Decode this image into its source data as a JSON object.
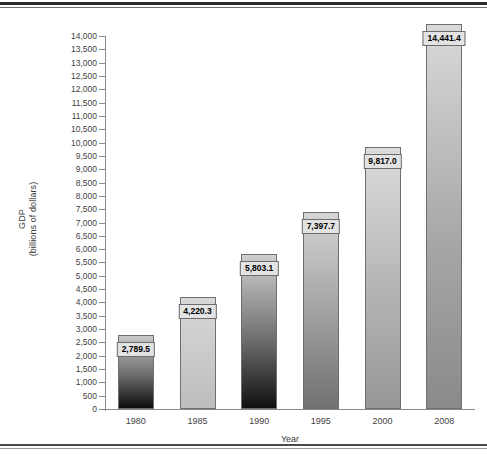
{
  "chart_data": {
    "type": "bar",
    "title": "",
    "categories": [
      "1980",
      "1985",
      "1990",
      "1995",
      "2000",
      "2008"
    ],
    "values": [
      2789.5,
      4220.3,
      5803.1,
      7397.7,
      9817.0,
      14441.4
    ],
    "value_labels": [
      "2,789.5",
      "4,220.3",
      "5,803.1",
      "7,397.7",
      "9,817.0",
      "14,441.4"
    ],
    "xlabel": "Year",
    "ylabel_line1": "GDP",
    "ylabel_line2": "(billions of dollars)",
    "ylim": [
      0,
      14000
    ],
    "ytick_step": 500,
    "ytick_labels": [
      "14,000",
      "13,500",
      "13,000",
      "12,500",
      "12,000",
      "11,500",
      "11,000",
      "10,500",
      "10,000",
      "9,500",
      "9,000",
      "8,500",
      "8,000",
      "7,500",
      "7,000",
      "6,500",
      "6,000",
      "5,500",
      "5,000",
      "4,500",
      "4,000",
      "3,500",
      "3,000",
      "2,500",
      "2,000",
      "1,500",
      "1,000",
      "500",
      "0"
    ],
    "ytick_values": [
      14000,
      13500,
      13000,
      12500,
      12000,
      11500,
      11000,
      10500,
      10000,
      9500,
      9000,
      8500,
      8000,
      7500,
      7000,
      6500,
      6000,
      5500,
      5000,
      4500,
      4000,
      3500,
      3000,
      2500,
      2000,
      1500,
      1000,
      500,
      0
    ],
    "grid": false,
    "legend": false,
    "bar_gradients": [
      {
        "top": "#c8c8c8",
        "mid": "#6a6a6a",
        "bottom": "#0d0d0d"
      },
      {
        "top": "#d8d8d8",
        "mid": "#c9c9c9",
        "bottom": "#bdbdbd"
      },
      {
        "top": "#cfcfcf",
        "mid": "#6f6f6f",
        "bottom": "#101010"
      },
      {
        "top": "#d5d5d5",
        "mid": "#9d9d9d",
        "bottom": "#717171"
      },
      {
        "top": "#dcdcdc",
        "mid": "#b4b4b4",
        "bottom": "#979797"
      },
      {
        "top": "#d9d9d9",
        "mid": "#a8a8a8",
        "bottom": "#8a8a8a"
      }
    ],
    "axis_color": "#8a8a8a",
    "label_box_fill": "#e3e3e3",
    "label_box_border": "#6b6b6b"
  }
}
